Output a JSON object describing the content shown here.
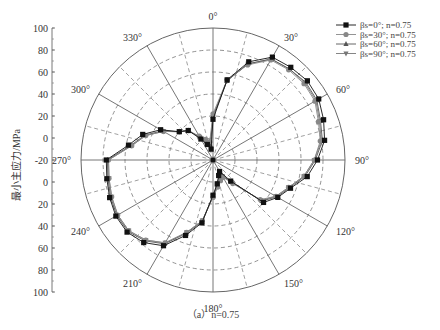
{
  "chart_data": {
    "type": "polar-line",
    "title": "",
    "caption": "（a）n=0.75",
    "ylabel": "最小主应力/MPa",
    "radial_range": [
      -20,
      100
    ],
    "radial_ticks_upper": [
      "100",
      "80",
      "60",
      "40",
      "20",
      "0",
      "-20"
    ],
    "radial_ticks_lower": [
      "0",
      "20",
      "40",
      "60",
      "80",
      "100"
    ],
    "radial_rings": [
      0,
      20,
      40,
      60,
      80
    ],
    "angle_labels": [
      "0°",
      "30°",
      "60°",
      "90°",
      "120°",
      "150°",
      "180°",
      "210°",
      "240°",
      "270°",
      "300°",
      "330°"
    ],
    "angles_deg": [
      0,
      10,
      20,
      30,
      40,
      50,
      60,
      70,
      80,
      90,
      100,
      110,
      120,
      130,
      140,
      150,
      160,
      170,
      180,
      190,
      200,
      210,
      220,
      230,
      240,
      250,
      260,
      270,
      280,
      290,
      300,
      310,
      320,
      330,
      340,
      350
    ],
    "series": [
      {
        "name": "βs=0°; n=0.75",
        "marker": "square",
        "color": "#111111",
        "values": [
          17,
          54,
          75,
          88,
          90,
          92,
          91,
          87,
          83,
          75,
          67,
          55,
          48,
          40,
          5,
          -8,
          -5,
          2,
          12,
          38,
          53,
          70,
          78,
          82,
          82,
          80,
          78,
          77,
          58,
          48,
          35,
          20,
          15,
          2,
          -5,
          -10
        ]
      },
      {
        "name": "βs=30°; n=0.75",
        "marker": "circle",
        "color": "#888888",
        "values": [
          22,
          54,
          72,
          85,
          87,
          88,
          87,
          82,
          79,
          72,
          64,
          53,
          46,
          36,
          8,
          -2,
          0,
          5,
          14,
          36,
          50,
          67,
          75,
          80,
          80,
          78,
          76,
          75,
          55,
          45,
          32,
          20,
          15,
          5,
          0,
          -3
        ]
      },
      {
        "name": "βs=60°; n=0.75",
        "marker": "triangle-up",
        "color": "#555555",
        "values": [
          20,
          53,
          73,
          86,
          88,
          90,
          89,
          84,
          81,
          73,
          65,
          54,
          47,
          38,
          6,
          -4,
          -2,
          3,
          13,
          37,
          51,
          68,
          76,
          81,
          81,
          79,
          77,
          76,
          56,
          46,
          33,
          20,
          15,
          4,
          -2,
          -6
        ]
      },
      {
        "name": "βs=90°; n=0.75",
        "marker": "triangle-down",
        "color": "#777777",
        "values": [
          19,
          53,
          73,
          86,
          88,
          89,
          88,
          83,
          80,
          72,
          64,
          53,
          46,
          37,
          7,
          -3,
          -1,
          4,
          13,
          36,
          50,
          67,
          75,
          80,
          80,
          78,
          76,
          75,
          55,
          45,
          32,
          20,
          15,
          4,
          -1,
          -5
        ]
      }
    ],
    "legend_position": "top-right",
    "grid": true
  },
  "legend": [
    {
      "label": "βs=0°; n=0.75"
    },
    {
      "label": "βs=30°; n=0.75"
    },
    {
      "label": "βs=60°; n=0.75"
    },
    {
      "label": "βs=90°; n=0.75"
    }
  ]
}
